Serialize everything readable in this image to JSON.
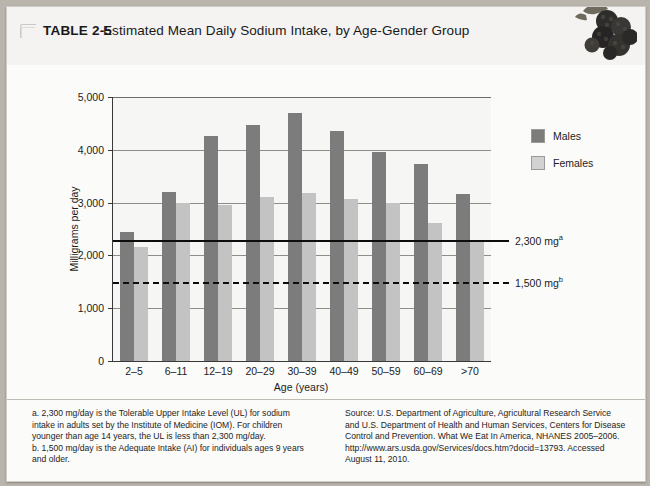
{
  "header": {
    "table_label": "TABLE 2-5",
    "title": "Estimated Mean Daily Sodium Intake, by Age-Gender Group",
    "icon": "table-corner-glyph",
    "photo": "blackberries-photo"
  },
  "legend": {
    "items": [
      {
        "label": "Males",
        "color": "#7c7c7c",
        "icon": "legend-swatch-males"
      },
      {
        "label": "Females",
        "color": "#d2d2d2",
        "icon": "legend-swatch-females"
      }
    ]
  },
  "reference_lines": [
    {
      "label": "2,300 mg",
      "sup": "a",
      "value": 2300,
      "style": "solid"
    },
    {
      "label": "1,500 mg",
      "sup": "b",
      "value": 1500,
      "style": "dashed"
    }
  ],
  "notes": {
    "left": [
      "a. 2,300 mg/day is the Tolerable Upper Intake Level (UL) for sodium",
      "intake in adults set by the Institute of Medicine (IOM). For children",
      "younger than age 14 years, the UL is less than 2,300 mg/day.",
      "b. 1,500 mg/day is the Adequate Intake (AI) for individuals ages 9 years",
      "and older."
    ],
    "right": [
      "Source: U.S. Department of Agriculture, Agricultural Research Service",
      "and U.S. Department of Health and Human Services, Centers for Disease",
      "Control and Prevention. What We Eat In America, NHANES 2005–2006.",
      "http://www.ars.usda.gov/Services/docs.htm?docid=13793. Accessed",
      "August 11, 2010."
    ]
  },
  "chart_data": {
    "type": "bar",
    "title": "Estimated Mean Daily Sodium Intake, by Age-Gender Group",
    "xlabel": "Age (years)",
    "ylabel": "Milligrams per day",
    "ylim": [
      0,
      5000
    ],
    "yticks": [
      0,
      1000,
      2000,
      3000,
      4000,
      5000
    ],
    "ytick_labels": [
      "0",
      "1,000",
      "2,000",
      "3,000",
      "4,000",
      "5,000"
    ],
    "grid": true,
    "legend_position": "upper-right-outside",
    "categories": [
      "2–5",
      "6–11",
      "12–19",
      "20–29",
      "30–39",
      "40–49",
      "50–59",
      "60–69",
      ">70"
    ],
    "series": [
      {
        "name": "Males",
        "color": "#7c7c7c",
        "values": [
          2450,
          3200,
          4270,
          4470,
          4700,
          4360,
          3960,
          3740,
          3160
        ]
      },
      {
        "name": "Females",
        "color": "#c3c3c3",
        "values": [
          2150,
          2990,
          2960,
          3110,
          3180,
          3060,
          3000,
          2610,
          2300
        ]
      }
    ],
    "annotations": [
      {
        "text": "2,300 mg",
        "superscript": "a",
        "y": 2300,
        "style": "solid"
      },
      {
        "text": "1,500 mg",
        "superscript": "b",
        "y": 1500,
        "style": "dashed"
      }
    ]
  }
}
